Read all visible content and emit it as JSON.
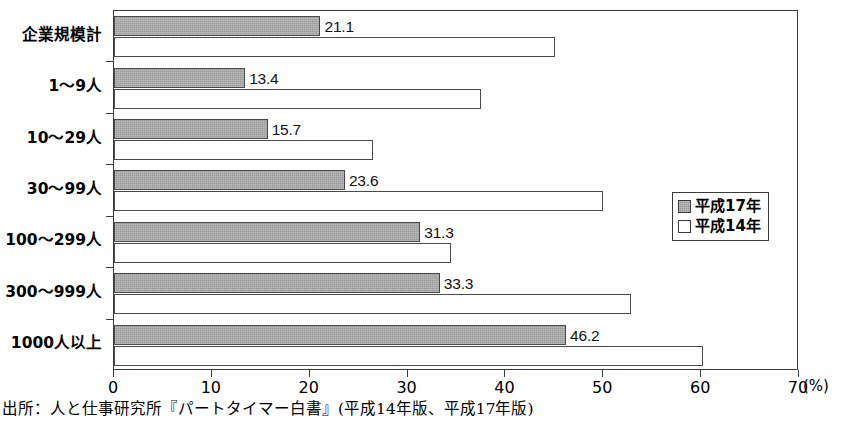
{
  "chart_data": {
    "type": "bar",
    "orientation": "horizontal",
    "title": "",
    "xlabel": "(%)",
    "ylabel": "",
    "xlim": [
      0,
      70
    ],
    "xticks": [
      0,
      10,
      20,
      30,
      40,
      50,
      60,
      70
    ],
    "xtick_labels": [
      "0",
      "10",
      "20",
      "30",
      "40",
      "50",
      "60",
      "70"
    ],
    "grid": false,
    "legend_position": "middle-right",
    "categories": [
      "企業規模計",
      "1〜9人",
      "10〜29人",
      "30〜99人",
      "100〜299人",
      "300〜999人",
      "1000人以上"
    ],
    "series": [
      {
        "name": "平成17年",
        "style": "gray",
        "color": "#9a9a9a",
        "labels_shown": true,
        "values": [
          21.1,
          13.4,
          15.7,
          23.6,
          31.3,
          33.3,
          46.2
        ],
        "value_labels": [
          "21.1",
          "13.4",
          "15.7",
          "23.6",
          "31.3",
          "33.3",
          "46.2"
        ]
      },
      {
        "name": "平成14年",
        "style": "white",
        "color": "#ffffff",
        "labels_shown": false,
        "values": [
          45.1,
          37.5,
          26.5,
          50.0,
          34.4,
          52.8,
          60.2
        ],
        "value_labels": [
          "",
          "",
          "",
          "",
          "",
          "",
          ""
        ]
      }
    ]
  },
  "legend": {
    "items": [
      {
        "label": "平成17年",
        "style": "gray"
      },
      {
        "label": "平成14年",
        "style": "white"
      }
    ]
  },
  "axis": {
    "unit_label": "(%)"
  },
  "source": {
    "note": "出所：人と仕事研究所『パートタイマー白書』(平成14年版、平成17年版)"
  },
  "colors": {
    "bar_gray": "#9a9a9a",
    "bar_white": "#ffffff",
    "line": "#3a3a3a",
    "text": "#000000"
  }
}
